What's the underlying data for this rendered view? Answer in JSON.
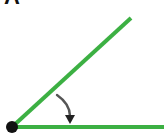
{
  "figure": {
    "panel_label": "A",
    "colors": {
      "ray": "#3cb043",
      "vertex": "#111111",
      "arrow": "#555555",
      "arrowhead": "#222222",
      "label": "#111111"
    },
    "vertex": {
      "x": 12,
      "y": 127,
      "r": 6
    },
    "ray_horizontal": {
      "x1": 12,
      "y1": 127,
      "x2": 164,
      "y2": 127
    },
    "ray_angled": {
      "x1": 12,
      "y1": 127,
      "x2": 131,
      "y2": 18
    },
    "rotation_arrow": {
      "direction": "clockwise",
      "from": "angled-ray",
      "to": "horizontal-ray"
    }
  }
}
